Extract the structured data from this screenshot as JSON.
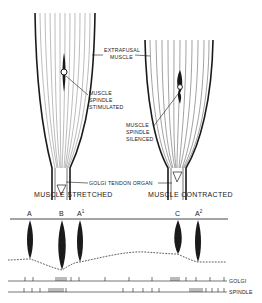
{
  "labels": {
    "extrafusal_line1": "EXTRAFUSAL",
    "extrafusal_line2": "MUSCLE",
    "stim_line1": "MUSCLE",
    "stim_line2": "SPINDLE",
    "stim_line3": "STIMULATED",
    "sil_line1": "MUSCLE",
    "sil_line2": "SPINDLE",
    "sil_line3": "SILENCED",
    "golgi_tendon_organ": "GOLGI TENDON ORGAN",
    "caption_left": "MUSCLE STRETCHED",
    "caption_right": "MUSCLE CONTRACTED"
  },
  "peaks": {
    "a": "A",
    "b": "B",
    "a1": "A",
    "a1_sup": "1",
    "c": "C",
    "a2": "A",
    "a2_sup": "2"
  },
  "traces": {
    "golgi": "GOLGI",
    "spindle": "SPINDLE"
  },
  "colors": {
    "ink": "#1a1a1a",
    "background": "#ffffff"
  }
}
